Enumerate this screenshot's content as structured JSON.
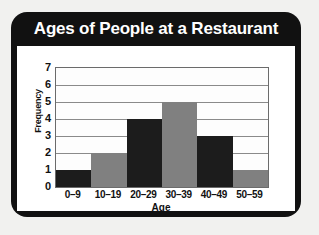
{
  "chart_data": {
    "type": "bar",
    "title": "Ages of People at a Restaurant",
    "xlabel": "Age",
    "ylabel": "Frequency",
    "categories": [
      "0–9",
      "10–19",
      "20–29",
      "30–39",
      "40–49",
      "50–59"
    ],
    "values": [
      1,
      2,
      4,
      5,
      3,
      1
    ],
    "bar_colors": [
      "#1c1c1c",
      "#808080",
      "#1c1c1c",
      "#808080",
      "#1c1c1c",
      "#808080"
    ],
    "ylim": [
      0,
      7
    ],
    "ytick_labels": [
      "0",
      "1",
      "2",
      "3",
      "4",
      "5",
      "6",
      "7"
    ],
    "ytick_values": [
      0,
      1,
      2,
      3,
      4,
      5,
      6,
      7
    ],
    "grid": true,
    "grid_axis": "y",
    "legend": false,
    "bar_gap": 0
  },
  "style": {
    "frame_color": "#111111",
    "title_color": "#ffffff",
    "page_background": "#f1f1ef",
    "plot_background": "#fdfdfd",
    "grid_color": "#8a8a8a",
    "axis_color": "#6b6b6b"
  }
}
